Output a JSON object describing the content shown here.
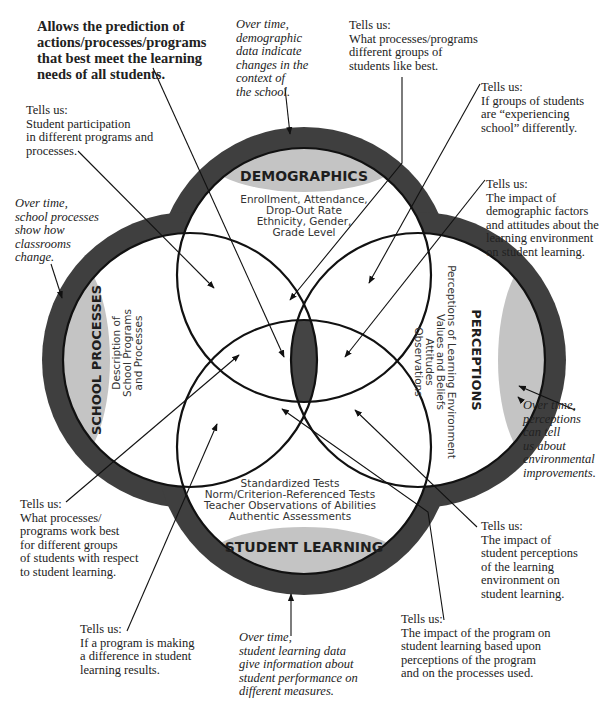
{
  "headline": "Allows the prediction of\nactions/processes/programs\nthat best meet the learning\nneeds of all students.",
  "circles": {
    "demographics": {
      "title": "DEMOGRAPHICS",
      "items": [
        "Enrollment, Attendance,",
        "Drop-Out Rate",
        "Ethnicity, Gender,",
        "Grade Level"
      ]
    },
    "school_processes": {
      "title": "SCHOOL PROCESSES",
      "items": [
        "Description of",
        "School Programs",
        "and Processes"
      ]
    },
    "perceptions": {
      "title": "PERCEPTIONS",
      "items": [
        "Perceptions of Learning Environment",
        "Values and Beliefs",
        "Attitudes",
        "Observations"
      ]
    },
    "student_learning": {
      "title": "STUDENT LEARNING",
      "items": [
        "Standardized Tests",
        "Norm/Criterion-Referenced Tests",
        "Teacher Observations of Abilities",
        "Authentic Assessments"
      ]
    }
  },
  "over_time": {
    "demographics": "Over time,\ndemographic\ndata indicate\nchanges in the\ncontext of\nthe school.",
    "school_processes": "Over time,\nschool processes\nshow how\nclassrooms\nchange.",
    "perceptions": "Over time,\nperceptions\ncan tell\nus about\nenvironmental\nimprovements.",
    "student_learning": "Over time,\nstudent learning data\ngive information about\nstudent performance on\ndifferent measures."
  },
  "tells_us": {
    "participation": "Tells us:\nStudent participation\nin different programs and\nprocesses.",
    "like_best": "Tells us:\nWhat processes/programs\ndifferent groups of\nstudents like best.",
    "experiencing": "Tells us:\nIf groups of students\nare “experiencing\nschool” differently.",
    "demographic_impact": "Tells us:\nThe impact of\ndemographic factors\nand attitudes about the\nlearning environment\non student learning.",
    "work_best": "Tells us:\nWhat processes/\nprograms work best\nfor different groups\nof students with respect\nto student learning.",
    "making_difference": "Tells us:\nIf a program is making\na difference in student\nlearning results.",
    "perception_impact": "Tells us:\nThe impact of\nstudent perceptions\nof the learning\nenvironment on\nstudent learning.",
    "program_impact": "Tells us:\nThe impact of the program on\nstudent learning based upon\nperceptions of the program\nand on the processes used."
  },
  "colors": {
    "band": "#3f3f3f",
    "label_fill": "#c4c4c4",
    "center_fill": "#444444",
    "line": "#111111"
  }
}
